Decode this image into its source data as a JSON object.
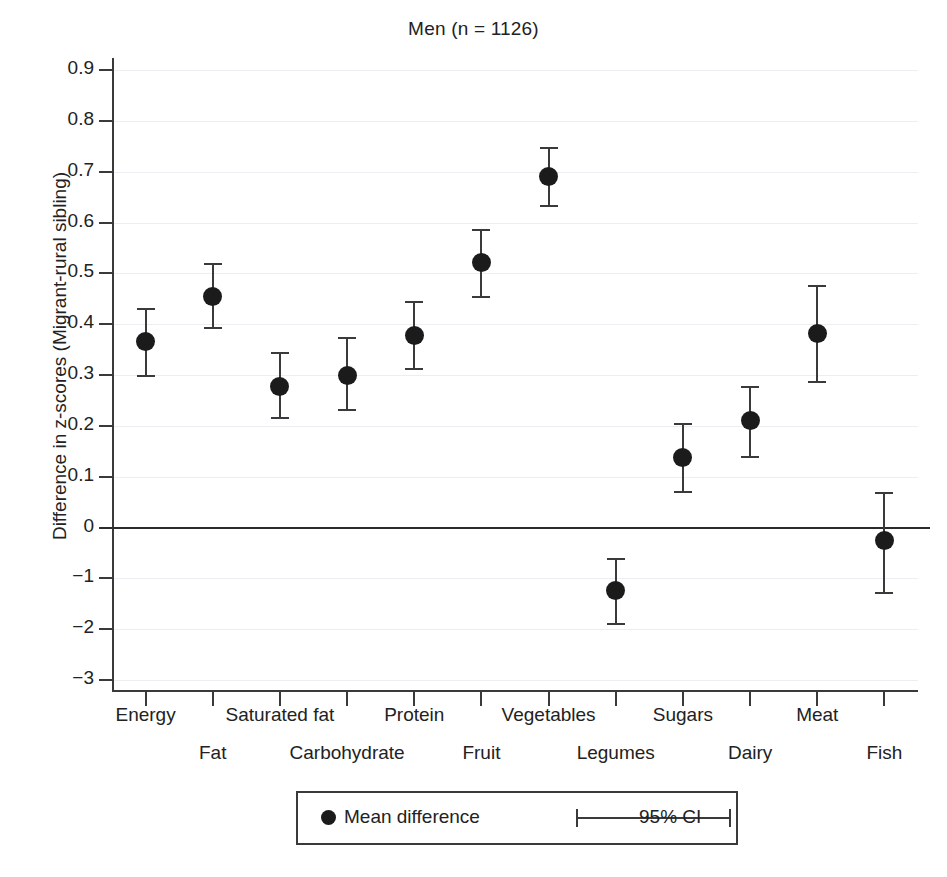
{
  "chart_data": {
    "type": "scatter",
    "title": "Men (n = 1126)",
    "xlabel": "",
    "ylabel": "Difference in z-scores (Migrant-rural sibling)",
    "grid": true,
    "legend_position": "bottom-center",
    "ylim": [
      -0.3,
      0.95
    ],
    "ytick_labels": [
      "0.9",
      "0.8",
      "0.7",
      "0.6",
      "0.5",
      "0.4",
      "0.3",
      "0.2",
      "0.1",
      "0",
      "−1",
      "−2",
      "−3"
    ],
    "ytick_values": [
      0.9,
      0.8,
      0.7,
      0.6,
      0.5,
      0.4,
      0.3,
      0.2,
      0.1,
      0,
      -0.1,
      -0.2,
      -0.3
    ],
    "zero_reference_line": 0,
    "categories": [
      "Energy",
      "Fat",
      "Saturated fat",
      "Carbohydrate",
      "Protein",
      "Fruit",
      "Vegetables",
      "Legumes",
      "Sugars",
      "Dairy",
      "Meat",
      "Fish"
    ],
    "series": [
      {
        "name": "Mean difference",
        "values": [
          0.365,
          0.455,
          0.278,
          0.3,
          0.378,
          0.521,
          0.69,
          -0.124,
          0.138,
          0.21,
          0.381,
          -0.026
        ],
        "ci_low": [
          0.297,
          0.39,
          0.214,
          0.23,
          0.31,
          0.452,
          0.63,
          -0.192,
          0.068,
          0.137,
          0.284,
          -0.131
        ],
        "ci_high": [
          0.432,
          0.52,
          0.345,
          0.374,
          0.445,
          0.588,
          0.748,
          -0.06,
          0.205,
          0.278,
          0.477,
          0.07
        ]
      }
    ],
    "legend": [
      {
        "marker": "dot",
        "label": "Mean difference"
      },
      {
        "marker": "errorbar",
        "label": "95% CI"
      }
    ],
    "colors": {
      "marker": "#1b1b1b",
      "errorbar": "#3a3a3a",
      "axis": "#3a3a3a",
      "gridline": "#ededf2",
      "zero_line": "#2b2b2b",
      "text": "#222222",
      "background": "#ffffff"
    }
  }
}
